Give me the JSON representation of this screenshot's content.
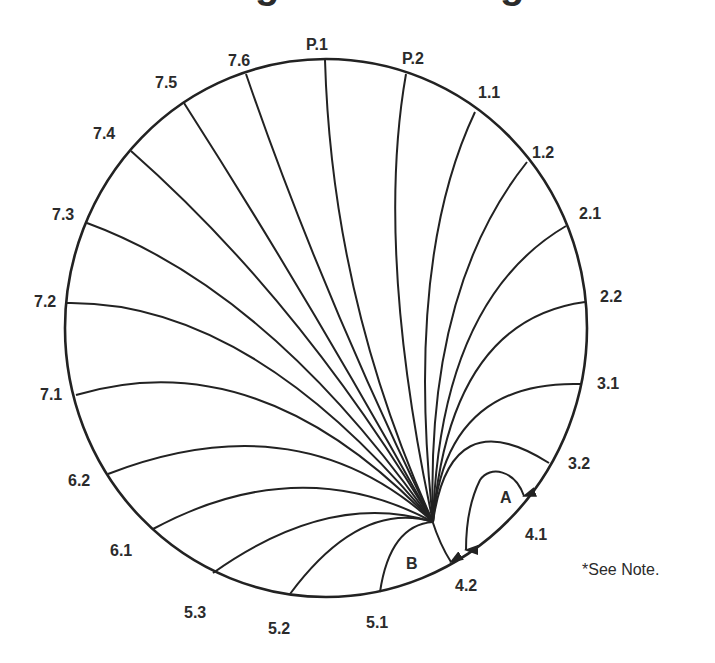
{
  "title_fragment": "…g…g…",
  "diagram": {
    "type": "converging-line diagram",
    "stroke_color": "#222222",
    "text_color": "#2b2b2b",
    "rim_labels": [
      "P.1",
      "P.2",
      "1.1",
      "1.2",
      "2.1",
      "2.2",
      "3.1",
      "3.2",
      "4.1",
      "4.2",
      "5.1",
      "5.2",
      "5.3",
      "6.1",
      "6.2",
      "7.1",
      "7.2",
      "7.3",
      "7.4",
      "7.5",
      "7.6"
    ],
    "lines_to_convergence": [
      "7.6",
      "P.1",
      "P.2",
      "1.1",
      "1.2",
      "2.1",
      "2.2",
      "3.1",
      "3.2",
      "7.5",
      "7.4",
      "7.3",
      "7.2",
      "7.1",
      "6.2",
      "6.1",
      "5.3",
      "5.2",
      "5.1"
    ],
    "main_arrow_target": "4.2",
    "region_labels": {
      "A": "A",
      "B": "B"
    },
    "note": "*See Note."
  }
}
